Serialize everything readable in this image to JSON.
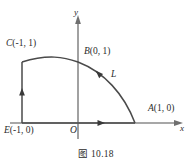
{
  "figure": {
    "caption": "图 10.18",
    "axes": {
      "x_label": "x",
      "y_label": "y",
      "origin_label": "O"
    },
    "points": [
      {
        "name": "C",
        "label": "C",
        "coord": "(-1, 1)",
        "x": -1,
        "y": 1
      },
      {
        "name": "B",
        "label": "B",
        "coord": "(0, 1)",
        "x": 0,
        "y": 1
      },
      {
        "name": "A",
        "label": "A",
        "coord": "(1, 0)",
        "x": 1,
        "y": 0
      },
      {
        "name": "E",
        "label": "E",
        "coord": "(-1, 0)",
        "x": -1,
        "y": 0
      }
    ],
    "curve_label": "L",
    "colors": {
      "ink": "#2b2b2b",
      "axis": "#8a8a8a",
      "curve": "#4a4a4a",
      "background": "#ffffff"
    }
  }
}
